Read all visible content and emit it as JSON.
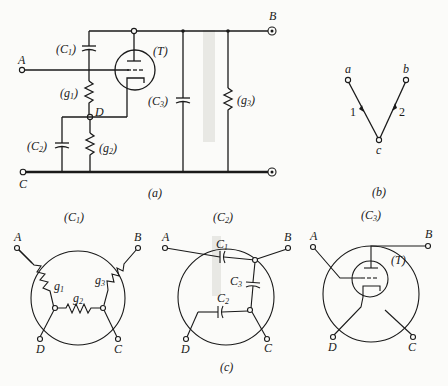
{
  "figure": {
    "panel_a": {
      "caption": "(a)",
      "terminals": {
        "A": "A",
        "B": "B",
        "C": "C"
      },
      "node_D": "D",
      "components": {
        "C1": {
          "open": "(",
          "name": "C",
          "sub": "1",
          "close": ")"
        },
        "C2": {
          "open": "(",
          "name": "C",
          "sub": "2",
          "close": ")"
        },
        "C3": {
          "open": "(",
          "name": "C",
          "sub": "3",
          "close": ")"
        },
        "g1": {
          "open": "(",
          "name": "g",
          "sub": "1",
          "close": ")"
        },
        "g2": {
          "open": "(",
          "name": "g",
          "sub": "2",
          "close": ")"
        },
        "g3": {
          "open": "(",
          "name": "g",
          "sub": "3",
          "close": ")"
        },
        "T": "(T)"
      }
    },
    "panel_b": {
      "caption": "(b)",
      "nodes": {
        "a": "a",
        "b": "b",
        "c": "c"
      },
      "branches": {
        "1": "1",
        "2": "2"
      }
    },
    "panel_c": {
      "caption": "(c)",
      "subgraphs": [
        {
          "title": {
            "open": "(",
            "name": "C",
            "sub": "1",
            "close": ")"
          },
          "terminals": {
            "A": "A",
            "B": "B",
            "C": "C",
            "D": "D"
          },
          "elements": [
            {
              "name": "g",
              "sub": "1"
            },
            {
              "name": "g",
              "sub": "2"
            },
            {
              "name": "g",
              "sub": "3"
            }
          ]
        },
        {
          "title": {
            "open": "(",
            "name": "C",
            "sub": "2",
            "close": ")"
          },
          "terminals": {
            "A": "A",
            "B": "B",
            "C": "C",
            "D": "D"
          },
          "elements": [
            {
              "name": "C",
              "sub": "1"
            },
            {
              "name": "C",
              "sub": "2"
            },
            {
              "name": "C",
              "sub": "3"
            }
          ]
        },
        {
          "title": {
            "open": "(",
            "name": "C",
            "sub": "3",
            "close": ")"
          },
          "terminals": {
            "A": "A",
            "B": "B",
            "C": "C",
            "D": "D"
          },
          "elements": [
            {
              "label": "(T)"
            }
          ]
        }
      ]
    }
  }
}
